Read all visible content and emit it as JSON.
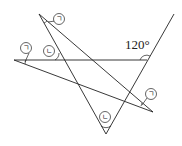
{
  "diagram": {
    "angle_label": "120°",
    "markers": {
      "a": "ㄱ",
      "b": "ㄴ"
    },
    "labels": [
      {
        "id": "a1",
        "text": "ㄱ"
      },
      {
        "id": "a2",
        "text": "ㄱ"
      },
      {
        "id": "a3",
        "text": "ㄱ"
      },
      {
        "id": "b1",
        "text": "ㄴ"
      },
      {
        "id": "b2",
        "text": "ㄴ"
      }
    ]
  }
}
